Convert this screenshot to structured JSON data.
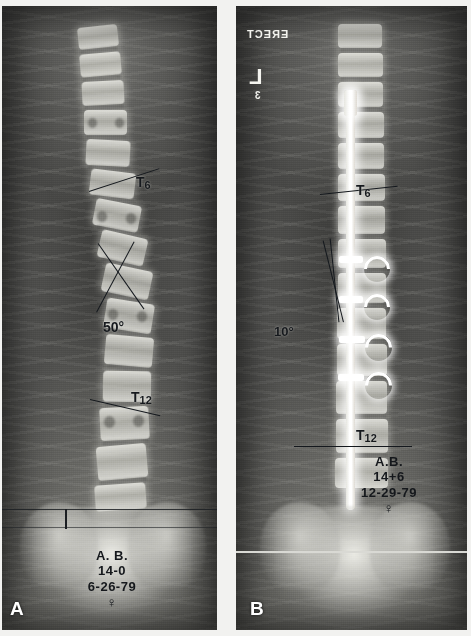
{
  "figure": {
    "type": "radiograph-comparison",
    "background_color": "#f2f2f0"
  },
  "panels": [
    {
      "id": "A",
      "letter": "A",
      "stage": "preoperative",
      "vertebra_labels": [
        {
          "key": "T6",
          "text": "T",
          "sub": "6"
        },
        {
          "key": "T12",
          "text": "T",
          "sub": "12"
        }
      ],
      "angle": {
        "value": "50",
        "unit": "°",
        "label": "50°"
      },
      "patient_stamp": {
        "initials": "A. B.",
        "age": "14-0",
        "date": "6-26-79",
        "sex_symbol": "♀"
      }
    },
    {
      "id": "B",
      "letter": "B",
      "stage": "postoperative",
      "vertebra_labels": [
        {
          "key": "T6",
          "text": "T",
          "sub": "6"
        },
        {
          "key": "T12",
          "text": "T",
          "sub": "12"
        }
      ],
      "angle": {
        "value": "10",
        "unit": "°",
        "label": "10°"
      },
      "patient_stamp": {
        "initials": "A.B.",
        "age": "14+6",
        "date": "12-29-79",
        "sex_symbol": "♀"
      },
      "lead_markers": {
        "erect": "ERECT",
        "side": "L",
        "small": "3"
      },
      "instrumentation": "posterior spinal rod with sublaminar hooks"
    }
  ],
  "colors": {
    "film_dark": "#3b3b3b",
    "bone_white": "#ecece6",
    "metal_white": "#ffffff",
    "annotation_ink": "#16191d",
    "lead_marker": "#f4f4ef",
    "page_background": "#f2f2f0"
  }
}
